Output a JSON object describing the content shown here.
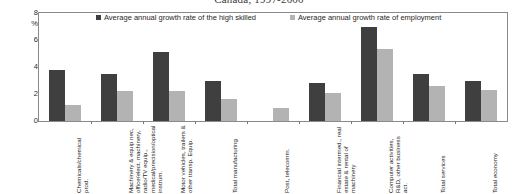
{
  "chart_data": {
    "type": "bar",
    "title": "Canada, 1997-2000",
    "xlabel": "",
    "ylabel": "%",
    "ylim": [
      0,
      8
    ],
    "yticks": [
      0,
      2,
      4,
      6,
      8
    ],
    "ytick_labels": [
      "0",
      "2",
      "4",
      "6",
      "8"
    ],
    "grid": false,
    "legend_position": "top-inside",
    "categories": [
      "Chemicals/chemical prod.",
      "Machinery & equip nec, office/elect. machinery, radio/TV equip., medical/precision/optical instrum.",
      "Motor vehicles, trailers & other transp. Equip.",
      "Total manufacturing",
      "Post, telecomm.",
      "Financial intermed., real estate & rental of machinery",
      "Computer activities, R&D, other business act.",
      "Total services",
      "Total economy"
    ],
    "series": [
      {
        "name": "Average annual growth rate of the high skilled",
        "color": "#3f3f3f",
        "values": [
          3.8,
          3.5,
          5.1,
          3.0,
          0.0,
          2.8,
          7.0,
          3.5,
          3.0
        ]
      },
      {
        "name": "Average annual growth rate of employment",
        "color": "#b3b3b3",
        "values": [
          1.2,
          2.2,
          2.25,
          1.6,
          1.0,
          2.1,
          5.3,
          2.6,
          2.3
        ]
      }
    ]
  },
  "axis": {
    "unit_label": "%"
  },
  "colors": {
    "series_high_skilled": "#3f3f3f",
    "series_employment": "#b3b3b3",
    "axis_line": "#8a8a8a",
    "text": "#1c1c1c"
  }
}
